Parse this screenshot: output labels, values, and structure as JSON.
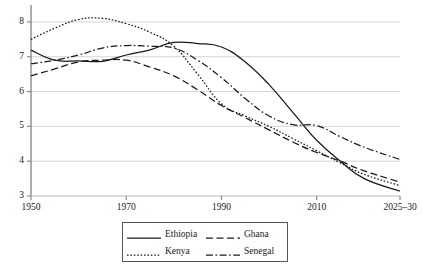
{
  "chart_data": {
    "type": "line",
    "title": "",
    "subtitle": "",
    "xlabel": "",
    "ylabel": "",
    "xlim": [
      1950,
      2027.5
    ],
    "ylim": [
      3,
      8.4
    ],
    "grid": true,
    "grid_on_y": true,
    "legend_position": "bottom-center",
    "x_tick_labels": [
      "1950",
      "1970",
      "1990",
      "2010",
      "2025–30"
    ],
    "x_tick_values": [
      1950,
      1970,
      1990,
      2010,
      2027.5
    ],
    "y_tick_labels": [
      "3",
      "4",
      "5",
      "6",
      "7",
      "8"
    ],
    "y_tick_values": [
      3,
      4,
      5,
      6,
      7,
      8
    ],
    "series": [
      {
        "name": "Ethiopia",
        "style": "solid",
        "color": "#1a1a1a",
        "x": [
          1950,
          1955,
          1960,
          1965,
          1970,
          1975,
          1980,
          1985,
          1990,
          1995,
          2000,
          2005,
          2010,
          2015,
          2020,
          2027.5
        ],
        "values": [
          7.19,
          6.9,
          6.88,
          6.87,
          7.05,
          7.2,
          7.41,
          7.38,
          7.28,
          6.85,
          6.2,
          5.4,
          4.6,
          4.0,
          3.5,
          3.14
        ]
      },
      {
        "name": "Ghana",
        "style": "dashed",
        "color": "#1a1a1a",
        "x": [
          1950,
          1955,
          1960,
          1965,
          1970,
          1975,
          1980,
          1985,
          1990,
          1995,
          2000,
          2005,
          2010,
          2015,
          2020,
          2027.5
        ],
        "values": [
          6.45,
          6.65,
          6.85,
          6.9,
          6.9,
          6.7,
          6.45,
          6.05,
          5.6,
          5.25,
          4.9,
          4.55,
          4.25,
          4.0,
          3.72,
          3.4
        ]
      },
      {
        "name": "Kenya",
        "style": "dotted",
        "color": "#1a1a1a",
        "x": [
          1950,
          1955,
          1960,
          1965,
          1970,
          1975,
          1980,
          1985,
          1990,
          1995,
          2000,
          2005,
          2010,
          2015,
          2020,
          2027.5
        ],
        "values": [
          7.5,
          7.82,
          8.07,
          8.1,
          7.95,
          7.7,
          7.3,
          6.5,
          5.65,
          5.3,
          5.0,
          4.65,
          4.3,
          3.95,
          3.62,
          3.3
        ]
      },
      {
        "name": "Senegal",
        "style": "dashdot",
        "color": "#1a1a1a",
        "x": [
          1950,
          1955,
          1960,
          1965,
          1970,
          1975,
          1980,
          1985,
          1990,
          1995,
          2000,
          2005,
          2010,
          2015,
          2020,
          2027.5
        ],
        "values": [
          6.8,
          6.9,
          7.05,
          7.25,
          7.32,
          7.3,
          7.25,
          6.9,
          6.4,
          5.8,
          5.3,
          5.05,
          5.02,
          4.7,
          4.4,
          4.05
        ]
      }
    ]
  },
  "axes": {
    "y_ticks": [
      {
        "label": "8",
        "value": 8
      },
      {
        "label": "7",
        "value": 7
      },
      {
        "label": "6",
        "value": 6
      },
      {
        "label": "5",
        "value": 5
      },
      {
        "label": "4",
        "value": 4
      },
      {
        "label": "3",
        "value": 3
      }
    ],
    "x_ticks": [
      {
        "label": "1950",
        "value": 1950
      },
      {
        "label": "1970",
        "value": 1970
      },
      {
        "label": "1990",
        "value": 1990
      },
      {
        "label": "2010",
        "value": 2010
      },
      {
        "label": "2025–30",
        "value": 2027.5
      }
    ]
  },
  "legend": {
    "entries": [
      {
        "label": "Ethiopia",
        "style": "solid"
      },
      {
        "label": "Ghana",
        "style": "dashed"
      },
      {
        "label": "Kenya",
        "style": "dotted"
      },
      {
        "label": "Senegal",
        "style": "dashdot"
      }
    ]
  },
  "colors": {
    "line": "#1a1a1a",
    "grid": "#c9c9c9",
    "axis": "#8a8a8a",
    "background": "#ffffff"
  }
}
